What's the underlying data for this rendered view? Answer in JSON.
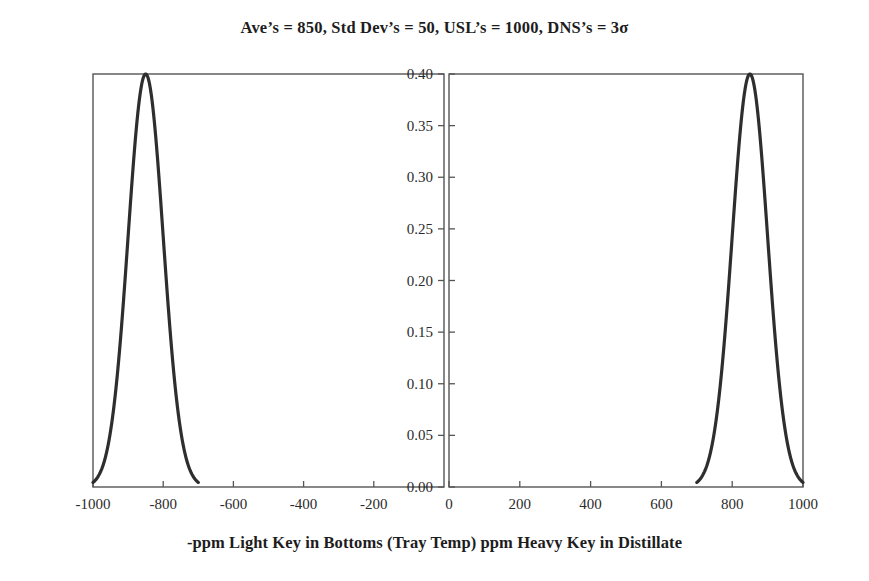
{
  "chart_data": {
    "type": "line",
    "title": "Ave’s = 850, Std Dev’s = 50, USL’s = 1000, DNS’s = 3σ",
    "xlabel": "-ppm Light Key in Bottoms (Tray Temp) ppm Heavy Key in Distillate",
    "ylabel": "Fraction of Samples",
    "grid": false,
    "legend": "none",
    "ylim": [
      0.0,
      0.4
    ],
    "ytick_labels": [
      "0.00",
      "0.05",
      "0.10",
      "0.15",
      "0.20",
      "0.25",
      "0.30",
      "0.35",
      "0.40"
    ],
    "ytick_values": [
      0.0,
      0.05,
      0.1,
      0.15,
      0.2,
      0.25,
      0.3,
      0.35,
      0.4
    ],
    "panels": [
      {
        "name": "left-panel",
        "xlim": [
          -1000,
          0
        ],
        "xtick_labels": [
          "-1000",
          "-800",
          "-600",
          "-400",
          "-200"
        ],
        "xtick_values": [
          -1000,
          -800,
          -600,
          -400,
          -200
        ],
        "series": [
          {
            "name": "light-key-distribution",
            "mean": -850,
            "std_dev": 50,
            "peak_value": 0.4,
            "x_start": -1000,
            "x_end": -700,
            "color": "#2e2e2e"
          }
        ]
      },
      {
        "name": "right-panel",
        "xlim": [
          0,
          1000
        ],
        "xtick_labels": [
          "0",
          "200",
          "400",
          "600",
          "800",
          "1000"
        ],
        "xtick_values": [
          0,
          200,
          400,
          600,
          800,
          1000
        ],
        "series": [
          {
            "name": "heavy-key-distribution",
            "mean": 850,
            "std_dev": 50,
            "peak_value": 0.4,
            "x_start": 700,
            "x_end": 1000,
            "color": "#2e2e2e"
          }
        ]
      }
    ],
    "annotations": {
      "averages": 850,
      "std_dev": 50,
      "usl": 1000,
      "dns_sigma": "3σ"
    }
  }
}
